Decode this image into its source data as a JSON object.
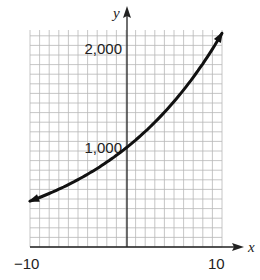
{
  "chart_data": {
    "type": "line",
    "title": "",
    "xlabel": "x",
    "ylabel": "y",
    "xlim": [
      -10,
      10
    ],
    "ylim": [
      0,
      2200
    ],
    "grid": true,
    "x_tick_labels": [
      "-10",
      "10"
    ],
    "y_tick_labels": [
      "1,000",
      "2,000"
    ],
    "x_ticks": [
      -10,
      10
    ],
    "y_ticks": [
      1000,
      2000
    ],
    "series": [
      {
        "name": "exponential growth curve",
        "x": [
          -10,
          -8,
          -6,
          -4,
          -2,
          0,
          2,
          4,
          6,
          8,
          10
        ],
        "values": [
          463,
          540,
          630,
          735,
          857,
          1000,
          1166,
          1360,
          1587,
          1851,
          2159
        ],
        "arrows_both_ends": true
      }
    ]
  },
  "labels": {
    "x_axis": "x",
    "y_axis": "y",
    "x_min": "−10",
    "x_max": "10",
    "y_1000": "1,000",
    "y_2000": "2,000"
  },
  "colors": {
    "grid": "#b8b8b8",
    "axis": "#222222",
    "curve": "#111111"
  }
}
